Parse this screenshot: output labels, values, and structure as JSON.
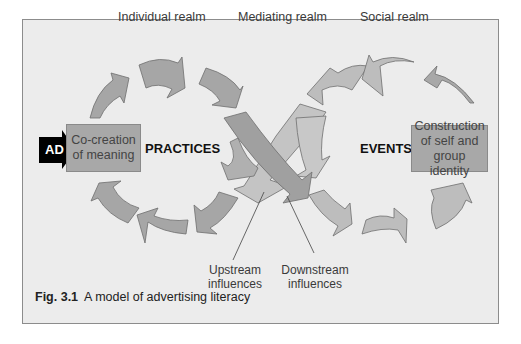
{
  "figure": {
    "caption_number": "Fig. 3.1",
    "caption_text": "A model of advertising literacy"
  },
  "realms": {
    "individual": "Individual realm",
    "mediating": "Mediating realm",
    "social": "Social realm"
  },
  "nodes": {
    "input": "AD",
    "left_box": [
      "Co-creation",
      "of meaning"
    ],
    "right_box": [
      "Construction",
      "of self and",
      "group identity"
    ],
    "left_cycle_label": "PRACTICES",
    "right_cycle_label": "EVENTS"
  },
  "callouts": {
    "upstream": [
      "Upstream",
      "influences"
    ],
    "downstream": [
      "Downstream",
      "influences"
    ]
  },
  "colors": {
    "frame_fill": "#ececec",
    "frame_border": "#8c8c8c",
    "arrow_fill_dark": "#a6a6a6",
    "arrow_fill_light": "#bdbdbd",
    "box_fill": "#a8a8a8",
    "ad_fill": "#000000"
  }
}
